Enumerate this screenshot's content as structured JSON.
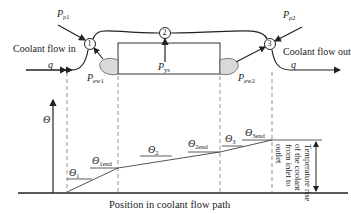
{
  "diagram": {
    "nodes": [
      {
        "id": "1",
        "label": "1"
      },
      {
        "id": "2",
        "label": "2"
      },
      {
        "id": "3",
        "label": "3"
      }
    ],
    "inlet_label": "Coolant flow in",
    "outlet_label": "Coolant flow out",
    "flow_in_symbol": "q",
    "flow_out_symbol": "q",
    "power_labels": {
      "p1": {
        "base": "P",
        "sub": "ρ1"
      },
      "p2": {
        "base": "P",
        "sub": "ρ2"
      },
      "pys": {
        "base": "P",
        "sub": "ys"
      },
      "pew1": {
        "base": "P",
        "sub": "ew1"
      },
      "pew2": {
        "base": "P",
        "sub": "ew2"
      }
    },
    "y_axis_label": "Θ",
    "theta_labels": {
      "t1": {
        "base": "Θ",
        "sub": "1"
      },
      "t1end": {
        "base": "Θ",
        "sub": "1end"
      },
      "t2": {
        "base": "Θ",
        "sub": "2"
      },
      "t2end": {
        "base": "Θ",
        "sub": "2end"
      },
      "t3": {
        "base": "Θ",
        "sub": "3"
      },
      "t3end": {
        "base": "Θ",
        "sub": "3end"
      }
    },
    "temperature_rise_lines": [
      "Temperature rise",
      "of the coolant",
      "from inlet to",
      "outlet"
    ],
    "x_axis_label": "Position in coolant flow path",
    "colors": {
      "line": "#222222",
      "lobe_fill": "#d9d9d9",
      "curve": "#555555",
      "dash": "#666666"
    }
  }
}
